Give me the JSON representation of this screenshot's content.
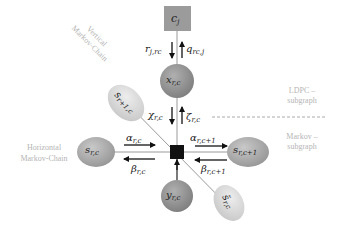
{
  "diagram": {
    "type": "factor-graph",
    "colors": {
      "background": "#ffffff",
      "check_node_fill": "#9b9b9b",
      "variable_node_fill": "#8f8f8f",
      "state_node_fill": "#a8a8a8",
      "state_node_light_fill": "#d6d6d6",
      "factor_node_fill": "#111111",
      "edge_color": "#9a9a9a",
      "arrow_color": "#111111",
      "region_label_color": "#b5b5b5"
    },
    "nodes": {
      "check": {
        "label": "c",
        "sub": "j"
      },
      "variable": {
        "label": "x",
        "sub": "r,c"
      },
      "observation": {
        "label": "y",
        "sub": "r,c"
      },
      "state_left": {
        "label": "s",
        "sub": "r,c"
      },
      "state_right": {
        "label": "s",
        "sub": "r,c+1"
      },
      "state_vertical_up": {
        "label": "s",
        "sub": "r+1,c"
      },
      "state_vertical_down": {
        "label": "s̃",
        "sub": "r,c"
      },
      "factor": {
        "label": ""
      }
    },
    "messages": {
      "r": {
        "label": "r",
        "sub": "j,rc"
      },
      "q": {
        "label": "q",
        "sub": "rc,j"
      },
      "chi": {
        "label": "χ",
        "sub": "r,c"
      },
      "zeta": {
        "label": "ζ",
        "sub": "r,c"
      },
      "alpha_left": {
        "label": "α",
        "sub": "r,c"
      },
      "beta_left": {
        "label": "β",
        "sub": "r,c"
      },
      "alpha_right": {
        "label": "α",
        "sub": "r,c+1"
      },
      "beta_right": {
        "label": "β",
        "sub": "r,c+1"
      }
    },
    "region_labels": {
      "vertical_line1": "Vertical",
      "vertical_line2": "Markov-Chain",
      "horizontal_line1": "Horizontal",
      "horizontal_line2": "Markov-Chain",
      "ldpc_line1": "LDPC –",
      "ldpc_line2": "subgraph",
      "markov_line1": "Markov –",
      "markov_line2": "subgraph"
    }
  }
}
